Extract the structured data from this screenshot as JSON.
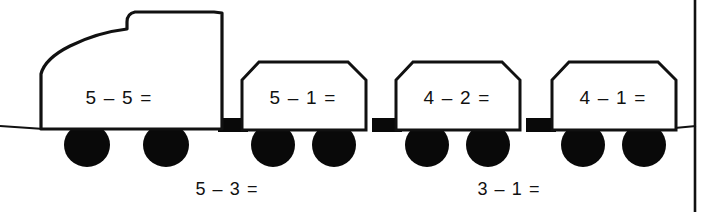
{
  "worksheet": {
    "title": "Subtraction Train",
    "width": 710,
    "height": 212,
    "background_color": "#ffffff",
    "ink_color": "#111111",
    "wheel_color": "#090909"
  },
  "train": {
    "locomotive": {
      "name": "locomotive",
      "problem": "5 – 5 =",
      "wheel_count": 2
    },
    "cars": [
      {
        "name": "car-1",
        "problem": "5 – 1 =",
        "wheel_count": 2
      },
      {
        "name": "car-2",
        "problem": "4 – 2 =",
        "wheel_count": 2
      },
      {
        "name": "car-3",
        "problem": "4 – 1 =",
        "wheel_count": 2
      }
    ]
  },
  "below_labels": [
    {
      "name": "below-label-1",
      "problem": "5 – 3 ="
    },
    {
      "name": "below-label-2",
      "problem": "3 – 1 ="
    }
  ]
}
